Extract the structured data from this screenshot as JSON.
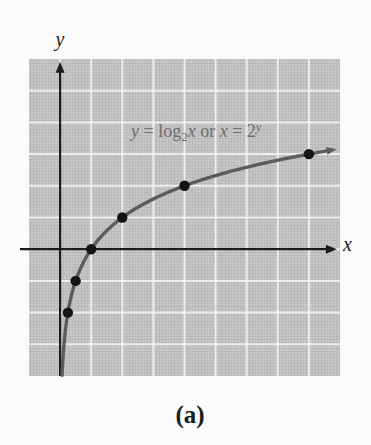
{
  "figure": {
    "caption": "(a)",
    "x_axis_label": "x",
    "y_axis_label": "y",
    "equation": {
      "lhs_var": "y",
      "equals1": " = ",
      "log_word": "log",
      "log_base": "2",
      "log_arg": "x",
      "or_word": " or ",
      "rhs_var": "x",
      "equals2": " = ",
      "base": "2",
      "exponent": "y"
    }
  },
  "chart_data": {
    "type": "line",
    "xlabel": "x",
    "ylabel": "y",
    "xlim": [
      -1,
      9
    ],
    "ylim": [
      -4,
      6
    ],
    "grid": true,
    "grid_x_lines": [
      0,
      1,
      2,
      3,
      4,
      5,
      6,
      7,
      8
    ],
    "grid_y_lines": [
      -3,
      -2,
      -1,
      0,
      1,
      2,
      3,
      4,
      5
    ],
    "function": "y = log2(x), equivalently x = 2^y",
    "curve_t_range": [
      -3.98,
      3.1
    ],
    "points": [
      {
        "x": 0.25,
        "y": -2
      },
      {
        "x": 0.5,
        "y": -1
      },
      {
        "x": 1,
        "y": 0
      },
      {
        "x": 2,
        "y": 1
      },
      {
        "x": 4,
        "y": 2
      },
      {
        "x": 8,
        "y": 3
      }
    ],
    "point_radius": 5.2,
    "x_axis": {
      "start": -1.29,
      "arrow_tip": 8.9
    },
    "y_axis": {
      "start": -4,
      "arrow_tip": 5.91
    },
    "legend": "none",
    "colors": {
      "panel": "#c8c8c8",
      "gridline": "#f5f5f5",
      "axis": "#1b1b1b",
      "curve": "#5c5c5c",
      "point": "#141414",
      "equation_text": "#6e6e6e"
    }
  }
}
